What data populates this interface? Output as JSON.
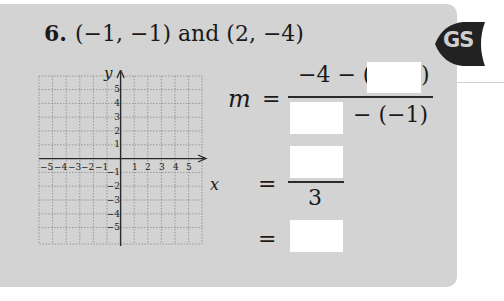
{
  "problem": {
    "number": "6.",
    "statement": "(−1, −1) and (2, −4)"
  },
  "badge": {
    "label": "GS",
    "color": "#222222"
  },
  "graph": {
    "x_axis_label": "x",
    "y_axis_label": "y",
    "x_ticks": [
      "−5",
      "−4",
      "−3",
      "−2",
      "−1",
      "1",
      "2",
      "3",
      "4",
      "5"
    ],
    "y_ticks_positive": [
      "5",
      "4",
      "3",
      "2",
      "1"
    ],
    "y_ticks_negative": [
      "−1",
      "−2",
      "−3",
      "−4",
      "−5"
    ]
  },
  "slope_work": {
    "variable": "m",
    "equals": "=",
    "line1_numerator_prefix": "−4 − (",
    "line1_numerator_suffix": ")",
    "line1_denominator_suffix": "− (−1)",
    "line2_denominator": "3",
    "blanks": {
      "y1_value": "",
      "x2_value": "",
      "numerator_result": "",
      "final_slope": ""
    }
  },
  "colors": {
    "card_bg": "#d3d3d3",
    "answer_box": "#ffffff"
  }
}
